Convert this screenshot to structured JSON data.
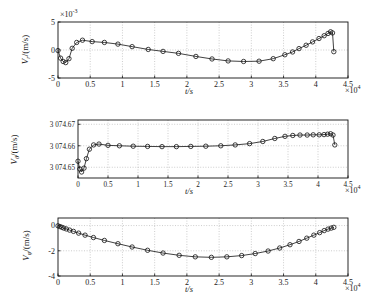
{
  "figure": {
    "title": "",
    "panel_count": 3
  },
  "chart_data": [
    {
      "type": "line",
      "panel_index": 0,
      "title": "",
      "xlabel": "t/s",
      "ylabel": "V_r/(m/s)",
      "ylabel_base": "V",
      "ylabel_sub": "r",
      "ylabel_unit": "/(m/s)",
      "x_exponent": "×10",
      "x_exponent_power": "4",
      "y_exponent": "×10",
      "y_exponent_power": "-3",
      "xlim": [
        0,
        4.5
      ],
      "ylim": [
        -5,
        5
      ],
      "xticks": [
        0,
        0.5,
        1,
        1.5,
        2,
        2.5,
        3,
        3.5,
        4,
        4.5
      ],
      "xticklabels": [
        "0",
        "0.5",
        "1",
        "1.5",
        "2",
        "2.5",
        "3",
        "3.5",
        "4",
        "4.5"
      ],
      "yticks": [
        -5,
        0,
        5
      ],
      "yticklabels": [
        "-5",
        "0",
        "5"
      ],
      "grid": true,
      "marker": "circle",
      "x": [
        0.0,
        0.04,
        0.08,
        0.12,
        0.17,
        0.22,
        0.29,
        0.38,
        0.53,
        0.72,
        0.93,
        1.15,
        1.4,
        1.63,
        1.87,
        2.14,
        2.39,
        2.64,
        2.88,
        3.12,
        3.34,
        3.52,
        3.64,
        3.74,
        3.85,
        3.95,
        4.05,
        4.13,
        4.19,
        4.23,
        4.26,
        4.28
      ],
      "y": [
        -0.1,
        -1.45,
        -2.05,
        -2.25,
        -1.55,
        0.3,
        1.35,
        1.75,
        1.5,
        1.35,
        1.05,
        0.6,
        0.1,
        -0.25,
        -0.6,
        -1.15,
        -1.6,
        -1.95,
        -2.05,
        -2.0,
        -1.55,
        -0.85,
        -0.35,
        0.25,
        0.85,
        1.45,
        2.05,
        2.55,
        2.95,
        3.25,
        3.05,
        -0.3
      ]
    },
    {
      "type": "line",
      "panel_index": 1,
      "title": "",
      "xlabel": "t/s",
      "ylabel": "V_θ/(m/s)",
      "ylabel_base": "V",
      "ylabel_sub": "θ",
      "ylabel_unit": "/(m/s)",
      "x_exponent": "×10",
      "x_exponent_power": "4",
      "y_exponent": "",
      "y_exponent_power": "",
      "xlim": [
        0,
        4.5
      ],
      "ylim": [
        3074.645,
        3074.672
      ],
      "xticks": [
        0,
        0.5,
        1,
        1.5,
        2,
        2.5,
        3,
        3.5,
        4,
        4.5
      ],
      "xticklabels": [
        "0",
        "0.5",
        "1",
        "1.5",
        "2",
        "2.5",
        "3",
        "3.5",
        "4",
        "4.5"
      ],
      "yticks": [
        3074.65,
        3074.66,
        3074.67
      ],
      "yticklabels": [
        "3 074.65",
        "3 074.66",
        "3 074.67"
      ],
      "grid": true,
      "marker": "circle",
      "x": [
        0.0,
        0.03,
        0.06,
        0.1,
        0.14,
        0.19,
        0.26,
        0.35,
        0.5,
        0.69,
        0.92,
        1.16,
        1.4,
        1.64,
        1.88,
        2.13,
        2.38,
        2.62,
        2.86,
        3.08,
        3.28,
        3.45,
        3.58,
        3.7,
        3.82,
        3.92,
        4.02,
        4.1,
        4.16,
        4.21,
        4.25,
        4.28
      ],
      "y": [
        3074.6528,
        3074.6492,
        3074.6478,
        3074.6496,
        3074.654,
        3074.6584,
        3074.6604,
        3074.6608,
        3074.6602,
        3074.66,
        3074.6598,
        3074.6597,
        3074.6596,
        3074.6596,
        3074.6597,
        3074.6598,
        3074.66,
        3074.6604,
        3074.661,
        3074.662,
        3074.6634,
        3074.6644,
        3074.6648,
        3074.665,
        3074.665,
        3074.6651,
        3074.6651,
        3074.6652,
        3074.6654,
        3074.6656,
        3074.665,
        3074.6604
      ]
    },
    {
      "type": "line",
      "panel_index": 2,
      "title": "",
      "xlabel": "t/s",
      "ylabel": "V_φ/(m/s)",
      "ylabel_base": "V",
      "ylabel_sub": "φ",
      "ylabel_unit": "/(m/s)",
      "x_exponent": "×10",
      "x_exponent_power": "4",
      "y_exponent": "",
      "y_exponent_power": "",
      "xlim": [
        0,
        4.5
      ],
      "ylim": [
        -4,
        0.6
      ],
      "xticks": [
        0,
        0.5,
        1,
        1.5,
        2,
        2.5,
        3,
        3.5,
        4,
        4.5
      ],
      "xticklabels": [
        "0",
        "0.5",
        "1",
        "1.5",
        "2",
        "2.5",
        "3",
        "3.5",
        "4",
        "4.5"
      ],
      "yticks": [
        -4,
        -2,
        0
      ],
      "yticklabels": [
        "-4",
        "-2",
        "0"
      ],
      "grid": true,
      "marker": "circle",
      "x": [
        0.0,
        0.03,
        0.06,
        0.09,
        0.13,
        0.18,
        0.24,
        0.32,
        0.42,
        0.55,
        0.72,
        0.93,
        1.15,
        1.39,
        1.63,
        1.88,
        2.13,
        2.38,
        2.62,
        2.85,
        3.06,
        3.26,
        3.44,
        3.6,
        3.74,
        3.86,
        3.97,
        4.06,
        4.13,
        4.19,
        4.24,
        4.28
      ],
      "y": [
        -0.02,
        -0.08,
        -0.14,
        -0.2,
        -0.27,
        -0.36,
        -0.46,
        -0.6,
        -0.76,
        -0.95,
        -1.18,
        -1.44,
        -1.7,
        -1.96,
        -2.18,
        -2.36,
        -2.48,
        -2.52,
        -2.48,
        -2.38,
        -2.22,
        -2.02,
        -1.78,
        -1.52,
        -1.26,
        -1.0,
        -0.76,
        -0.56,
        -0.4,
        -0.28,
        -0.2,
        -0.14
      ]
    }
  ]
}
